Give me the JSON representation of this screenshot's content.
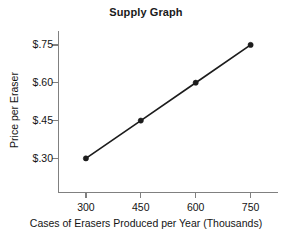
{
  "chart_data": {
    "type": "line",
    "title": "Supply Graph",
    "xlabel": "Cases of Erasers Produced per Year (Thousands)",
    "ylabel": "Price per Eraser",
    "x": [
      300,
      450,
      600,
      750
    ],
    "values": [
      0.3,
      0.45,
      0.6,
      0.75
    ],
    "series": [
      {
        "name": "Supply",
        "points": [
          {
            "x": 300,
            "y": 0.3
          },
          {
            "x": 450,
            "y": 0.45
          },
          {
            "x": 600,
            "y": 0.6
          },
          {
            "x": 750,
            "y": 0.75
          }
        ]
      }
    ],
    "xticks": [
      "300",
      "450",
      "600",
      "750"
    ],
    "yticks": [
      "$.75",
      "$.60",
      "$.45",
      "$.30"
    ],
    "ytick_values": [
      0.75,
      0.6,
      0.45,
      0.3
    ],
    "xlim": [
      225,
      825
    ],
    "ylim": [
      0.165,
      0.795
    ],
    "grid": false,
    "legend": false,
    "marker": "circle",
    "colors": {
      "line": "#1c1c1c",
      "marker": "#1c1c1c",
      "axis": "#808080",
      "text": "#141414",
      "background": "#ffffff"
    }
  }
}
